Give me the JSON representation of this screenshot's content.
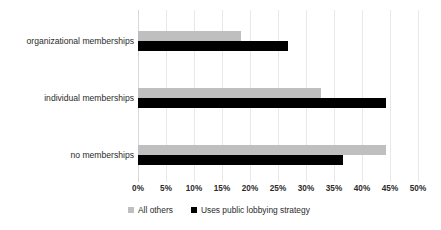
{
  "chart_data": {
    "type": "bar",
    "orientation": "horizontal",
    "title": "",
    "subtitle": "",
    "xlabel": "",
    "ylabel": "",
    "categories": [
      "organizational memberships",
      "individual memberships",
      "no memberships"
    ],
    "series": [
      {
        "name": "All others",
        "color": "#bfbfbf",
        "values": [
          18.4,
          32.7,
          44.3
        ]
      },
      {
        "name": "Uses public lobbying strategy",
        "color": "#000000",
        "values": [
          26.8,
          44.3,
          36.6
        ]
      }
    ],
    "xlim": [
      0,
      50
    ],
    "xtick_values": [
      0,
      5,
      10,
      15,
      20,
      25,
      30,
      35,
      40,
      45,
      50
    ],
    "xtick_labels": [
      "0%",
      "5%",
      "10%",
      "15%",
      "20%",
      "25%",
      "30%",
      "35%",
      "40%",
      "45%",
      "50%"
    ],
    "grid": true,
    "grid_axis": "x",
    "legend_position": "bottom-left",
    "value_suffix": "%"
  },
  "legend": {
    "entries": [
      {
        "label": "All others",
        "swatch": "legend-swatch-gray"
      },
      {
        "label": "Uses public lobbying strategy",
        "swatch": "legend-swatch-black"
      }
    ]
  }
}
